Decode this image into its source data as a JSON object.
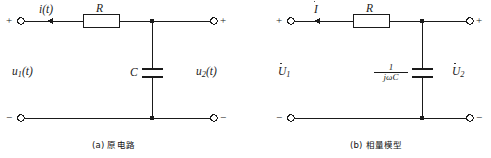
{
  "figure": {
    "type": "circuit-diagram",
    "line_color": "#1a1a1a",
    "background": "#ffffff"
  },
  "circuits": [
    {
      "id": "original-circuit",
      "caption": "(a) 原电路",
      "terminals": {
        "top_left_sign": "+",
        "bottom_left_sign": "−",
        "top_right_sign": "+",
        "bottom_right_sign": "−"
      },
      "labels": {
        "current": "i(t)",
        "resistor": "R",
        "capacitor": "C",
        "input_voltage_base": "u",
        "input_voltage_sub": "1",
        "input_voltage_arg": "(t)",
        "output_voltage_base": "u",
        "output_voltage_sub": "2",
        "output_voltage_arg": "(t)"
      },
      "components": [
        {
          "name": "resistor-R",
          "kind": "resistor",
          "label": "R"
        },
        {
          "name": "capacitor-C",
          "kind": "capacitor",
          "label": "C"
        }
      ]
    },
    {
      "id": "phasor-model",
      "caption": "(b) 相量模型",
      "terminals": {
        "top_left_sign": "+",
        "bottom_left_sign": "−",
        "top_right_sign": "+",
        "bottom_right_sign": "−"
      },
      "labels": {
        "current": "I",
        "resistor": "R",
        "impedance_numerator": "1",
        "impedance_denominator": "jωC",
        "input_voltage_base": "U",
        "input_voltage_sub": "1",
        "output_voltage_base": "U",
        "output_voltage_sub": "2"
      },
      "components": [
        {
          "name": "resistor-R",
          "kind": "resistor",
          "label": "R"
        },
        {
          "name": "capacitor-impedance",
          "kind": "capacitor",
          "label": "1/(jωC)"
        }
      ]
    }
  ]
}
